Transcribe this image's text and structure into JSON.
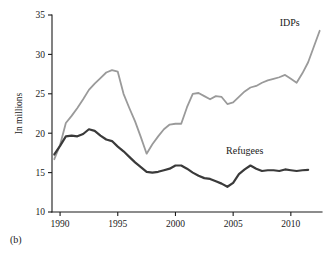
{
  "figure": {
    "panel_label": "(b)"
  },
  "chart_data": {
    "type": "line",
    "title": "",
    "xlabel": "",
    "ylabel": "In millions",
    "xlim": [
      1989.3,
      2012.7
    ],
    "ylim": [
      10,
      35
    ],
    "grid": false,
    "legend_position": "inline-right",
    "x_ticks": [
      1990,
      1995,
      2000,
      2005,
      2010
    ],
    "x_tick_labels": [
      "1990",
      "1995",
      "2000",
      "2005",
      "2010"
    ],
    "y_ticks": [
      10,
      15,
      20,
      25,
      30,
      35
    ],
    "y_tick_labels": [
      "10",
      "15",
      "20",
      "25",
      "30",
      "35"
    ],
    "series": [
      {
        "name": "IDPs",
        "color": "#9a9a9a",
        "label_x": 2009.9,
        "label_y": 33.6,
        "x": [
          1989.5,
          1990,
          1990.5,
          1991,
          1991.5,
          1992,
          1992.5,
          1993,
          1993.5,
          1994,
          1994.5,
          1995,
          1995.5,
          1996,
          1996.5,
          1997,
          1997.5,
          1998,
          1998.5,
          1999,
          1999.5,
          2000,
          2000.5,
          2001,
          2001.5,
          2002,
          2002.5,
          2003,
          2003.5,
          2004,
          2004.5,
          2005,
          2005.5,
          2006,
          2006.5,
          2007,
          2007.5,
          2008,
          2008.5,
          2009,
          2009.5,
          2010,
          2010.5,
          2011,
          2011.5,
          2012,
          2012.5
        ],
        "y": [
          16.7,
          18.5,
          21.3,
          22.2,
          23.2,
          24.3,
          25.5,
          26.3,
          27.0,
          27.7,
          28.0,
          27.8,
          25.0,
          23.2,
          21.5,
          19.5,
          17.4,
          18.6,
          19.6,
          20.5,
          21.1,
          21.2,
          21.2,
          23.3,
          25.0,
          25.1,
          24.7,
          24.3,
          24.7,
          24.6,
          23.7,
          23.9,
          24.6,
          25.3,
          25.8,
          26.0,
          26.4,
          26.7,
          26.9,
          27.1,
          27.4,
          26.9,
          26.4,
          27.6,
          29.0,
          31.0,
          33.0
        ]
      },
      {
        "name": "Refugees",
        "color": "#3a3a3a",
        "label_x": 2006.0,
        "label_y": 17.3,
        "x": [
          1989.5,
          1990,
          1990.5,
          1991,
          1991.5,
          1992,
          1992.5,
          1993,
          1993.5,
          1994,
          1994.5,
          1995,
          1995.5,
          1996,
          1996.5,
          1997,
          1997.5,
          1998,
          1998.5,
          1999,
          1999.5,
          2000,
          2000.5,
          2001,
          2001.5,
          2002,
          2002.5,
          2003,
          2003.5,
          2004,
          2004.5,
          2005,
          2005.5,
          2006,
          2006.5,
          2007,
          2007.5,
          2008,
          2008.5,
          2009,
          2009.5,
          2010,
          2010.5,
          2011,
          2011.5
        ],
        "y": [
          17.3,
          18.4,
          19.6,
          19.7,
          19.6,
          19.9,
          20.5,
          20.3,
          19.7,
          19.2,
          19.0,
          18.3,
          17.7,
          17.0,
          16.3,
          15.7,
          15.1,
          15.0,
          15.1,
          15.3,
          15.5,
          15.9,
          15.9,
          15.5,
          15.0,
          14.6,
          14.3,
          14.2,
          13.9,
          13.6,
          13.2,
          13.7,
          14.8,
          15.4,
          15.9,
          15.5,
          15.2,
          15.3,
          15.3,
          15.2,
          15.4,
          15.3,
          15.2,
          15.3,
          15.35
        ]
      }
    ]
  }
}
